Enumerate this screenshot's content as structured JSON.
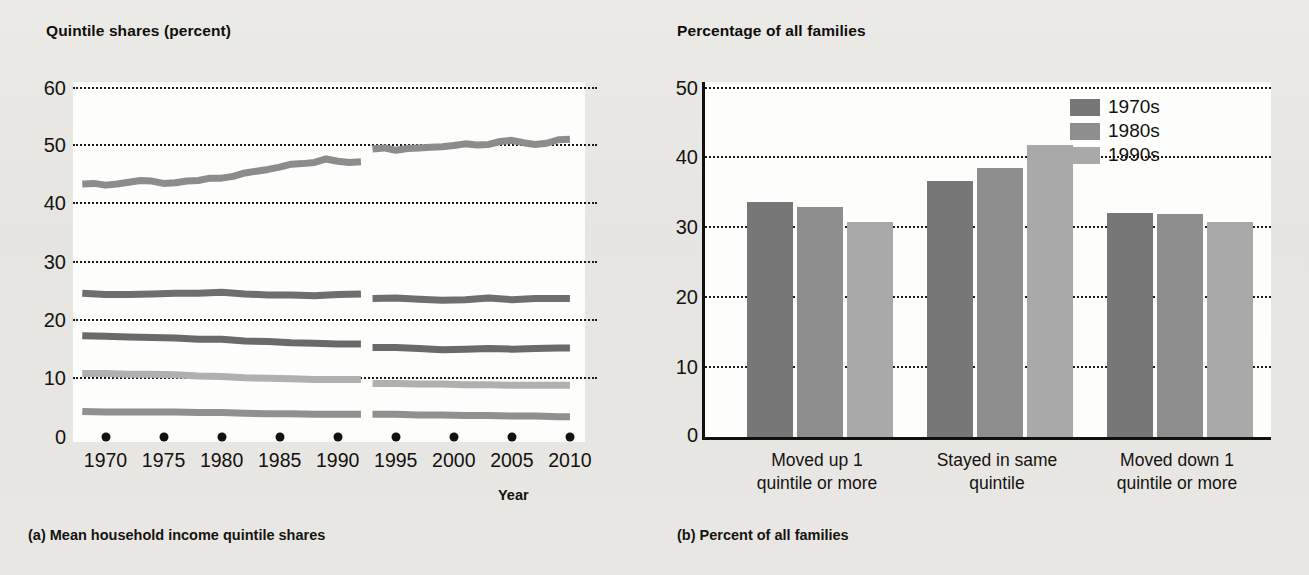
{
  "figure": {
    "background": "#e9e8e4"
  },
  "panel_a": {
    "title": "Quintile shares (percent)",
    "caption": "(a) Mean household income quintile shares",
    "xaxis_title": "Year"
  },
  "panel_b": {
    "title": "Percentage of all families",
    "caption": "(b) Percent of all families"
  },
  "colors": {
    "series_1970s": "#777777",
    "series_1980s": "#8e8e8e",
    "series_1990s": "#a9a9a9",
    "quintile_top": "#8c8c8c",
    "quintile_fourth": "#6e6e6e",
    "quintile_third": "#6a6a6a",
    "quintile_second": "#b0b0b0",
    "quintile_lowest": "#909090",
    "grid": "#1a1a18",
    "axis": "#111111",
    "plot_background": "#fdfdfc"
  },
  "chart_data": [
    {
      "type": "line",
      "title": "Quintile shares (percent)",
      "subtitle": "(a) Mean household income quintile shares",
      "xlabel": "Year",
      "ylabel": "Quintile shares (percent)",
      "xlim": [
        1967,
        2011
      ],
      "ylim": [
        0,
        60
      ],
      "yticks": [
        0,
        10,
        20,
        30,
        40,
        50,
        60
      ],
      "xticks": [
        1970,
        1975,
        1980,
        1985,
        1990,
        1995,
        2000,
        2005,
        2010
      ],
      "grid": "horizontal-dotted",
      "legend": "none",
      "note": "Series are broken between 1992 and 1993 due to a survey redesign",
      "break_between": [
        1992,
        1993
      ],
      "series": [
        {
          "name": "Highest quintile",
          "color": "#8c8c8c",
          "segments": [
            {
              "x": [
                1968,
                1969,
                1970,
                1971,
                1972,
                1973,
                1974,
                1975,
                1976,
                1977,
                1978,
                1979,
                1980,
                1981,
                1982,
                1983,
                1984,
                1985,
                1986,
                1987,
                1988,
                1989,
                1990,
                1991,
                1992
              ],
              "y": [
                43.5,
                43.6,
                43.3,
                43.5,
                43.8,
                44.1,
                44.0,
                43.6,
                43.7,
                44.0,
                44.1,
                44.5,
                44.5,
                44.8,
                45.4,
                45.7,
                46.0,
                46.4,
                46.9,
                47.0,
                47.2,
                47.8,
                47.4,
                47.2,
                47.3
              ]
            },
            {
              "x": [
                1993,
                1994,
                1995,
                1996,
                1997,
                1998,
                1999,
                2000,
                2001,
                2002,
                2003,
                2004,
                2005,
                2006,
                2007,
                2008,
                2009,
                2010
              ],
              "y": [
                49.5,
                49.7,
                49.3,
                49.6,
                49.7,
                49.8,
                49.9,
                50.1,
                50.4,
                50.2,
                50.3,
                50.8,
                51.0,
                50.6,
                50.3,
                50.5,
                51.1,
                51.2
              ]
            }
          ]
        },
        {
          "name": "Fourth quintile",
          "color": "#6e6e6e",
          "segments": [
            {
              "x": [
                1968,
                1970,
                1972,
                1974,
                1976,
                1978,
                1980,
                1982,
                1984,
                1986,
                1988,
                1990,
                1992
              ],
              "y": [
                24.7,
                24.5,
                24.5,
                24.6,
                24.7,
                24.7,
                24.9,
                24.6,
                24.4,
                24.4,
                24.3,
                24.5,
                24.6
              ]
            },
            {
              "x": [
                1993,
                1995,
                1997,
                1999,
                2001,
                2003,
                2005,
                2007,
                2009,
                2010
              ],
              "y": [
                23.8,
                23.9,
                23.7,
                23.5,
                23.6,
                23.9,
                23.6,
                23.8,
                23.8,
                23.8
              ]
            }
          ]
        },
        {
          "name": "Third quintile",
          "color": "#6a6a6a",
          "segments": [
            {
              "x": [
                1968,
                1970,
                1972,
                1974,
                1976,
                1978,
                1980,
                1982,
                1984,
                1986,
                1988,
                1990,
                1992
              ],
              "y": [
                17.4,
                17.3,
                17.2,
                17.1,
                17.0,
                16.8,
                16.8,
                16.5,
                16.4,
                16.2,
                16.1,
                16.0,
                16.0
              ]
            },
            {
              "x": [
                1993,
                1995,
                1997,
                1999,
                2001,
                2003,
                2005,
                2007,
                2009,
                2010
              ],
              "y": [
                15.4,
                15.4,
                15.2,
                15.0,
                15.1,
                15.2,
                15.1,
                15.2,
                15.3,
                15.3
              ]
            }
          ]
        },
        {
          "name": "Second quintile",
          "color": "#b0b0b0",
          "segments": [
            {
              "x": [
                1968,
                1970,
                1972,
                1974,
                1976,
                1978,
                1980,
                1982,
                1984,
                1986,
                1988,
                1990,
                1992
              ],
              "y": [
                10.9,
                10.9,
                10.8,
                10.8,
                10.7,
                10.5,
                10.4,
                10.2,
                10.1,
                10.0,
                9.9,
                9.9,
                9.9
              ]
            },
            {
              "x": [
                1993,
                1995,
                1997,
                1999,
                2001,
                2003,
                2005,
                2007,
                2009,
                2010
              ],
              "y": [
                9.2,
                9.2,
                9.1,
                9.1,
                9.0,
                9.0,
                8.9,
                8.9,
                8.9,
                8.9
              ]
            }
          ]
        },
        {
          "name": "Lowest quintile",
          "color": "#909090",
          "segments": [
            {
              "x": [
                1968,
                1970,
                1972,
                1974,
                1976,
                1978,
                1980,
                1982,
                1984,
                1986,
                1988,
                1990,
                1992
              ],
              "y": [
                4.4,
                4.3,
                4.3,
                4.3,
                4.3,
                4.2,
                4.2,
                4.1,
                4.0,
                4.0,
                3.9,
                3.9,
                3.9
              ]
            },
            {
              "x": [
                1993,
                1995,
                1997,
                1999,
                2001,
                2003,
                2005,
                2007,
                2009,
                2010
              ],
              "y": [
                3.9,
                3.9,
                3.8,
                3.8,
                3.7,
                3.7,
                3.6,
                3.6,
                3.5,
                3.5
              ]
            }
          ]
        }
      ]
    },
    {
      "type": "bar",
      "title": "Percentage of all families",
      "subtitle": "(b) Percent of all families",
      "xlabel": "",
      "ylabel": "Percentage of all families",
      "ylim": [
        0,
        50
      ],
      "yticks": [
        0,
        10,
        20,
        30,
        40,
        50
      ],
      "grid": "horizontal-dotted",
      "legend_position": "top-right",
      "categories": [
        "Moved up 1 quintile or more",
        "Stayed in same quintile",
        "Moved down 1 quintile or more"
      ],
      "series": [
        {
          "name": "1970s",
          "color": "#777777",
          "values": [
            33.5,
            36.5,
            31.9
          ]
        },
        {
          "name": "1980s",
          "color": "#8e8e8e",
          "values": [
            32.8,
            38.4,
            31.8
          ]
        },
        {
          "name": "1990s",
          "color": "#a9a9a9",
          "values": [
            30.6,
            41.7,
            30.6
          ]
        }
      ]
    }
  ],
  "panel_a_ticks": {
    "y": [
      "60",
      "50",
      "40",
      "30",
      "20",
      "10",
      "0"
    ],
    "x": [
      "1970",
      "1975",
      "1980",
      "1985",
      "1990",
      "1995",
      "2000",
      "2005",
      "2010"
    ]
  },
  "panel_b_ticks": {
    "y": [
      "50",
      "40",
      "30",
      "20",
      "10",
      "0"
    ]
  },
  "panel_b_groups": [
    {
      "line1": "Moved up 1",
      "line2": "quintile or more"
    },
    {
      "line1": "Stayed in same",
      "line2": "quintile"
    },
    {
      "line1": "Moved down 1",
      "line2": "quintile or more"
    }
  ],
  "legend": {
    "items": [
      {
        "label": "1970s",
        "color": "#777777"
      },
      {
        "label": "1980s",
        "color": "#8e8e8e"
      },
      {
        "label": "1990s",
        "color": "#a9a9a9"
      }
    ]
  }
}
